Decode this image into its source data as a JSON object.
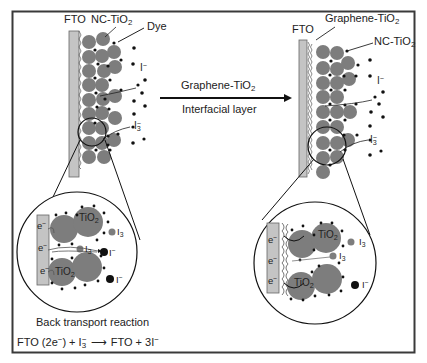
{
  "left_panel": {
    "label_fto": "FTO",
    "label_nc_tio2_base": "NC-TiO",
    "label_nc_tio2_sub": "2",
    "label_dye": "Dye",
    "label_iodide_base": "I",
    "label_iodide_sup": "−",
    "label_triiodide_base": "I",
    "label_triiodide_sup": "−",
    "label_triiodide_sub": "3"
  },
  "arrow": {
    "top_label_base": "Graphene-TiO",
    "top_label_sub": "2",
    "bottom_label": "Interfacial layer"
  },
  "right_panel": {
    "label_fto": "FTO",
    "label_graphene_tio2_base": "Graphene-TiO",
    "label_graphene_tio2_sub": "2",
    "label_nc_tio2_base": "NC-TiO",
    "label_nc_tio2_sub": "2",
    "label_iodide_base": "I",
    "label_iodide_sup": "−",
    "label_triiodide_base": "I",
    "label_triiodide_sup": "−",
    "label_triiodide_sub": "3"
  },
  "left_inset": {
    "electron_labels": [
      "e",
      "e",
      "e"
    ],
    "electron_sup": "−",
    "tio2_top_base": "TiO",
    "tio2_top_sub": "2",
    "tio2_bottom_base": "TiO",
    "tio2_bottom_sub": "2",
    "triiodide_inner_base": "I",
    "triiodide_inner_sub": "3",
    "triiodide_outer_base": "I",
    "triiodide_outer_sub": "3",
    "iodide_1_base": "I",
    "iodide_2_base": "I",
    "ion_sup": "−"
  },
  "right_inset": {
    "electron_labels": [
      "e",
      "e",
      "e"
    ],
    "electron_sup": "−",
    "tio2_top_base": "TiO",
    "tio2_top_sub": "2",
    "tio2_bottom_base": "TiO",
    "tio2_bottom_sub": "2",
    "triiodide_inner_base": "I",
    "triiodide_inner_sub": "3",
    "triiodide_outer_base": "I",
    "triiodide_outer_sub": "3",
    "iodide_base": "I",
    "ion_sup": "−"
  },
  "caption": {
    "title": "Back transport reaction",
    "eq_lhs": "FTO (2e",
    "eq_lhs_sup": "−",
    "eq_lhs_close": ") + I",
    "eq_i3_sub": "3",
    "eq_i3_sup": "−",
    "eq_rhs": "FTO + 3I",
    "eq_rhs_sup": "−"
  },
  "colors": {
    "frame": "#3a3a3a",
    "fto_fill": "#c4c4c4",
    "particle_fill": "#7d7d7d",
    "dot_fill": "#111111",
    "text": "#222222"
  }
}
